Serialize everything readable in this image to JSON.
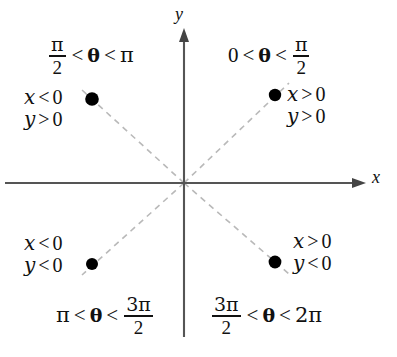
{
  "figure": {
    "background_color": "#ffffff",
    "axis_color": "#555555",
    "dash_color": "#b9b9b9",
    "dot_color": "#000000"
  },
  "axes": {
    "x_label": "x",
    "y_label": "y",
    "origin": {
      "x": 184,
      "y": 183
    },
    "x_start": 5,
    "x_end": 366,
    "y_top": 28,
    "y_bottom": 337
  },
  "quadrants": [
    {
      "id": "quadrant-1",
      "angle_range": {
        "left": "0",
        "left_is_fraction": false,
        "op1": "<",
        "theta": "θ",
        "op2": "<",
        "right_num": "π",
        "right_den": "2",
        "right_is_fraction": true
      },
      "x_sign": {
        "var": "x",
        "op": ">",
        "value": "0"
      },
      "y_sign": {
        "var": "y",
        "op": ">",
        "value": "0"
      },
      "dot": {
        "x": 275,
        "y": 95
      }
    },
    {
      "id": "quadrant-2",
      "angle_range": {
        "left_num": "π",
        "left_den": "2",
        "left_is_fraction": true,
        "op1": "<",
        "theta": "θ",
        "op2": "<",
        "right": "π",
        "right_is_fraction": false
      },
      "x_sign": {
        "var": "x",
        "op": "<",
        "value": "0"
      },
      "y_sign": {
        "var": "y",
        "op": ">",
        "value": "0"
      },
      "dot": {
        "x": 92,
        "y": 99
      }
    },
    {
      "id": "quadrant-3",
      "angle_range": {
        "left": "π",
        "left_is_fraction": false,
        "op1": "<",
        "theta": "θ",
        "op2": "<",
        "right_num": "3π",
        "right_den": "2",
        "right_is_fraction": true
      },
      "x_sign": {
        "var": "x",
        "op": "<",
        "value": "0"
      },
      "y_sign": {
        "var": "y",
        "op": "<",
        "value": "0"
      },
      "dot": {
        "x": 92,
        "y": 264
      }
    },
    {
      "id": "quadrant-4",
      "angle_range": {
        "left_num": "3π",
        "left_den": "2",
        "left_is_fraction": true,
        "op1": "<",
        "theta": "θ",
        "op2": "<",
        "right": "2π",
        "right_is_fraction": false
      },
      "x_sign": {
        "var": "x",
        "op": ">",
        "value": "0"
      },
      "y_sign": {
        "var": "y",
        "op": "<",
        "value": "0"
      },
      "dot": {
        "x": 275,
        "y": 262
      }
    }
  ],
  "labels": {
    "q1_angle": {
      "a": "0",
      "op1": "<",
      "theta": "θ",
      "op2": "<",
      "num": "π",
      "den": "2"
    },
    "q2_angle": {
      "num": "π",
      "den": "2",
      "op1": "<",
      "theta": "θ",
      "op2": "<",
      "b": "π"
    },
    "q3_angle": {
      "a": "π",
      "op1": "<",
      "theta": "θ",
      "op2": "<",
      "num": "3π",
      "den": "2"
    },
    "q4_angle": {
      "num": "3π",
      "den": "2",
      "op1": "<",
      "theta": "θ",
      "op2": "<",
      "b": "2π"
    },
    "q1_x": {
      "var": "x",
      "op": ">",
      "val": "0"
    },
    "q1_y": {
      "var": "y",
      "op": ">",
      "val": "0"
    },
    "q2_x": {
      "var": "x",
      "op": "<",
      "val": "0"
    },
    "q2_y": {
      "var": "y",
      "op": ">",
      "val": "0"
    },
    "q3_x": {
      "var": "x",
      "op": "<",
      "val": "0"
    },
    "q3_y": {
      "var": "y",
      "op": "<",
      "val": "0"
    },
    "q4_x": {
      "var": "x",
      "op": ">",
      "val": "0"
    },
    "q4_y": {
      "var": "y",
      "op": "<",
      "val": "0"
    },
    "axis_x": "x",
    "axis_y": "y"
  }
}
